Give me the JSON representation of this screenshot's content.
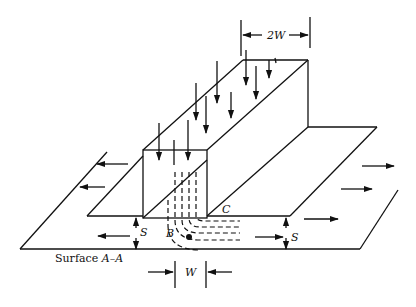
{
  "figure": {
    "labels": {
      "top_width": "2W",
      "bottom_width": "W",
      "left_spacing": "S",
      "right_spacing": "S",
      "point_b": "B",
      "point_c": "C",
      "surface_caption_prefix": "Surface ",
      "surface_caption_name": "A–A"
    },
    "colors": {
      "stroke": "#111111",
      "background": "#ffffff"
    },
    "arrows": {
      "downward_load_count": 11,
      "left_outward_count": 3,
      "right_outward_count": 4
    }
  }
}
